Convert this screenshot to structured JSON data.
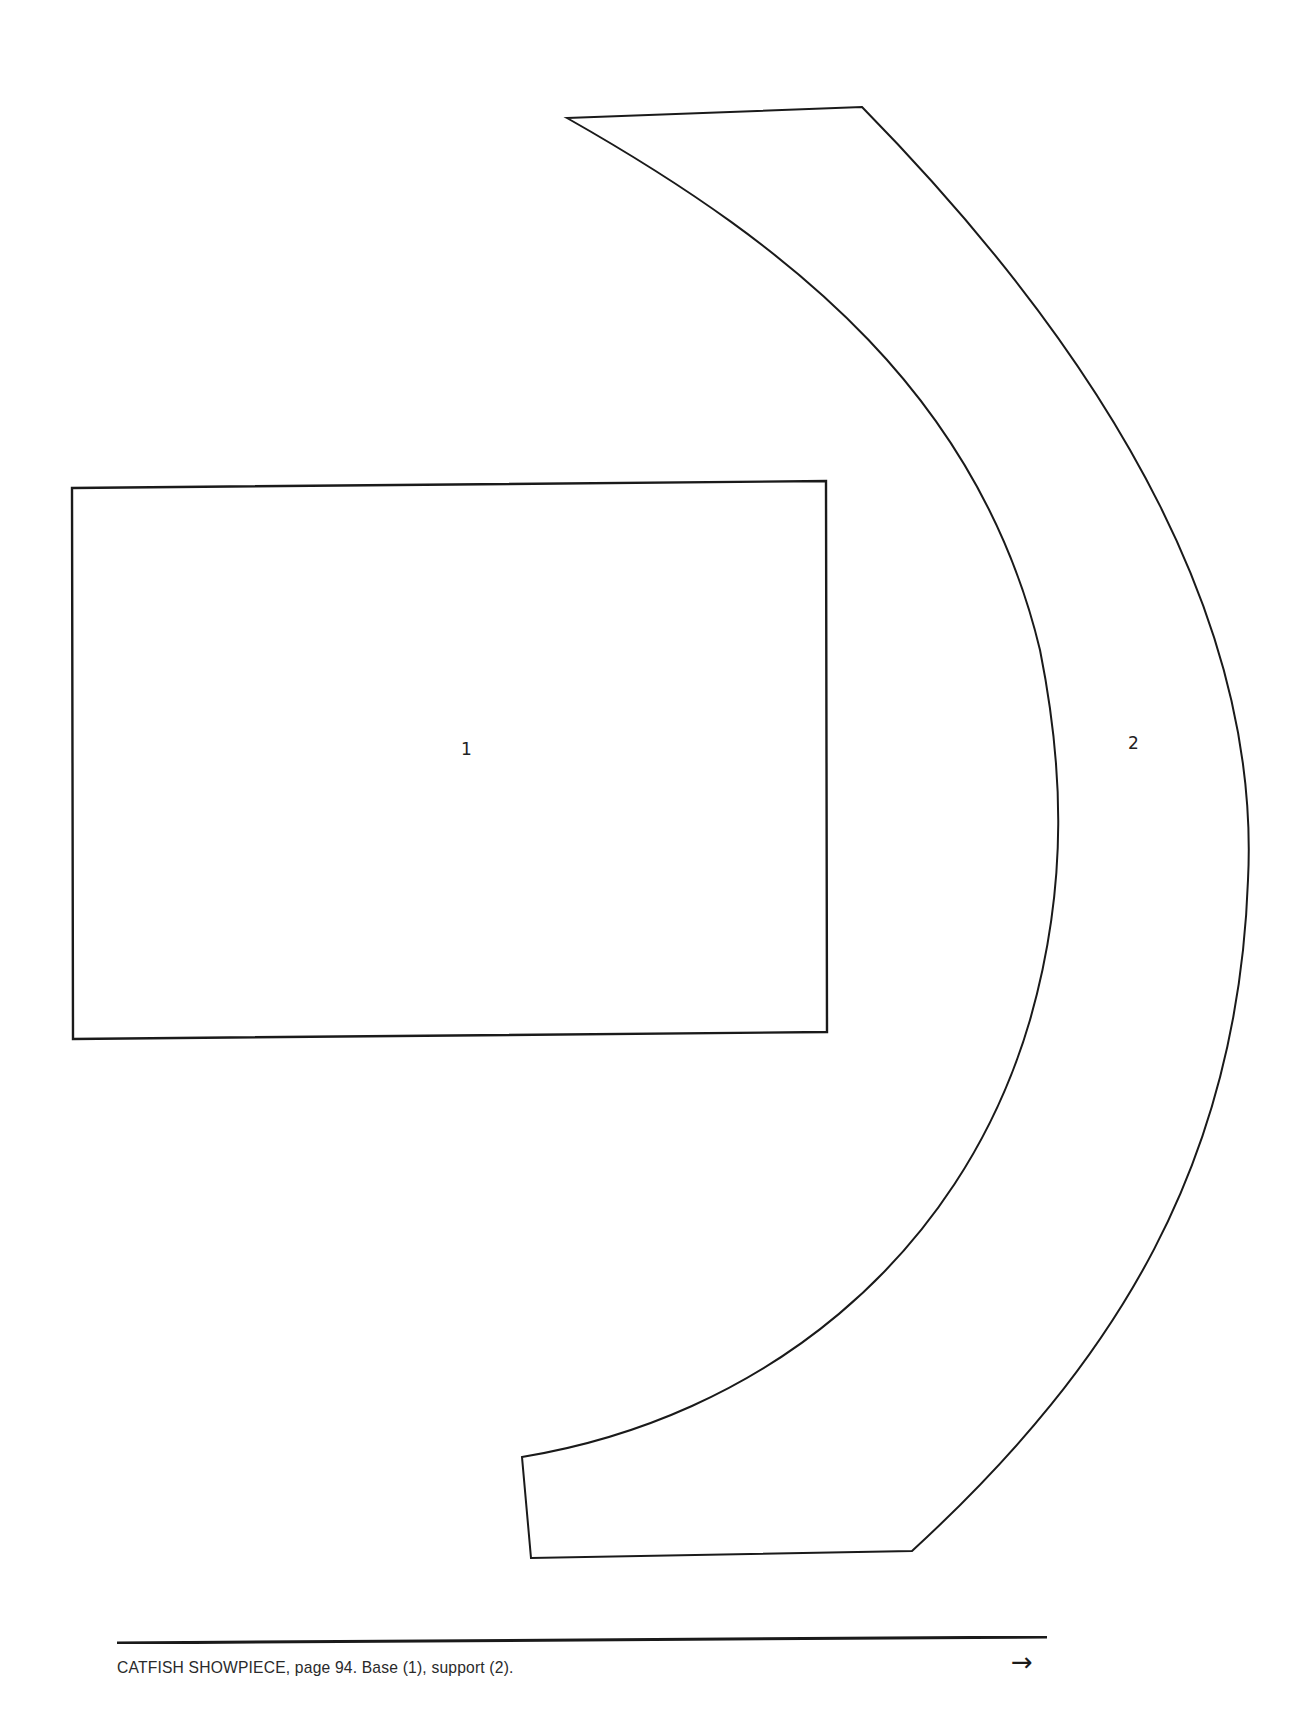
{
  "document": {
    "type": "pattern-template-page",
    "pieces": [
      {
        "id": "1",
        "label": "1",
        "name": "Base",
        "shape": "rectangle"
      },
      {
        "id": "2",
        "name": "Support",
        "label": "2",
        "shape": "curved-band"
      }
    ],
    "footer": {
      "caption": "CATFISH SHOWPIECE, page 94. Base (1), support (2).",
      "title": "CATFISH SHOWPIECE",
      "page_number": "94",
      "arrow_icon": "→"
    },
    "colors": {
      "line": "#1a1a1a",
      "background": "#ffffff"
    }
  }
}
